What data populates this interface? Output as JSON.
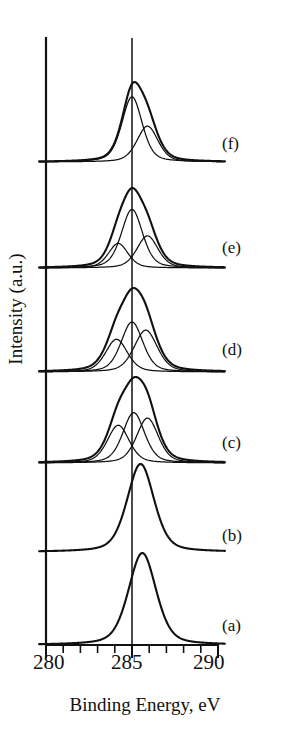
{
  "figure": {
    "background": "#ffffff",
    "ink_color": "#111111"
  },
  "axes": {
    "xlabel": "Binding Energy, eV",
    "ylabel": "Intensity (a.u.)",
    "x_tick_labels": [
      "280",
      "285",
      "290"
    ],
    "reference_line_value": "285"
  },
  "curve_labels": {
    "a": "(a)",
    "b": "(b)",
    "c": "(c)",
    "d": "(d)",
    "e": "(e)",
    "f": "(f)"
  },
  "chart_data": {
    "type": "line",
    "title": "",
    "subtitle": "",
    "xlabel": "Binding Energy, eV",
    "ylabel": "Intensity (a.u.)",
    "xlim": [
      279.0,
      290.6
    ],
    "x_major_ticks": [
      280,
      285,
      290
    ],
    "x_minor_ticks": [
      281,
      282,
      283,
      284,
      286,
      287,
      288,
      289
    ],
    "tick_direction": "out",
    "grid": false,
    "legend": "none",
    "y_axis_ticks": false,
    "annotations": [
      {
        "text": "(a)",
        "x": 290.2,
        "kind": "curve-label"
      },
      {
        "text": "(b)",
        "x": 290.2,
        "kind": "curve-label"
      },
      {
        "text": "(c)",
        "x": 290.2,
        "kind": "curve-label"
      },
      {
        "text": "(d)",
        "x": 290.2,
        "kind": "curve-label"
      },
      {
        "text": "(e)",
        "x": 290.2,
        "kind": "curve-label"
      },
      {
        "text": "(f)",
        "x": 290.2,
        "kind": "curve-label"
      }
    ],
    "reference_lines": [
      {
        "x": 285,
        "orientation": "vertical"
      }
    ],
    "stacked_offset": true,
    "series": [
      {
        "name": "(a)",
        "label": "(a)",
        "role": "envelope",
        "baseline_px": 645,
        "height_px": 92,
        "x_start": 279.6,
        "x_end": 290.4,
        "components": [
          {
            "center": 285.6,
            "fwhm": 1.9,
            "amplitude": 1.0
          }
        ]
      },
      {
        "name": "(b)",
        "label": "(b)",
        "role": "envelope",
        "baseline_px": 552,
        "height_px": 88,
        "x_start": 279.6,
        "x_end": 290.4,
        "components": [
          {
            "center": 285.5,
            "fwhm": 1.85,
            "amplitude": 1.0
          }
        ]
      },
      {
        "name": "(c)",
        "label": "(c)",
        "role": "envelope-with-components",
        "baseline_px": 463,
        "height_px": 86,
        "x_start": 279.6,
        "x_end": 290.4,
        "components": [
          {
            "center": 284.2,
            "fwhm": 1.5,
            "amplitude": 0.42
          },
          {
            "center": 285.1,
            "fwhm": 1.5,
            "amplitude": 0.56
          },
          {
            "center": 285.9,
            "fwhm": 1.5,
            "amplitude": 0.5
          }
        ]
      },
      {
        "name": "(d)",
        "label": "(d)",
        "role": "envelope-with-components",
        "baseline_px": 372,
        "height_px": 84,
        "x_start": 279.6,
        "x_end": 290.4,
        "components": [
          {
            "center": 284.1,
            "fwhm": 1.5,
            "amplitude": 0.36
          },
          {
            "center": 285.0,
            "fwhm": 1.5,
            "amplitude": 0.55
          },
          {
            "center": 285.8,
            "fwhm": 1.6,
            "amplitude": 0.46
          }
        ]
      },
      {
        "name": "(e)",
        "label": "(e)",
        "role": "envelope-with-components",
        "baseline_px": 268,
        "height_px": 80,
        "x_start": 279.6,
        "x_end": 290.4,
        "components": [
          {
            "center": 284.2,
            "fwhm": 1.35,
            "amplitude": 0.26
          },
          {
            "center": 285.0,
            "fwhm": 1.45,
            "amplitude": 0.62
          },
          {
            "center": 285.9,
            "fwhm": 1.45,
            "amplitude": 0.34
          }
        ]
      },
      {
        "name": "(f)",
        "label": "(f)",
        "role": "envelope-with-components",
        "baseline_px": 162,
        "height_px": 80,
        "x_start": 279.6,
        "x_end": 290.4,
        "components": [
          {
            "center": 285.0,
            "fwhm": 1.4,
            "amplitude": 0.6
          },
          {
            "center": 285.9,
            "fwhm": 1.45,
            "amplitude": 0.33
          }
        ]
      }
    ]
  }
}
